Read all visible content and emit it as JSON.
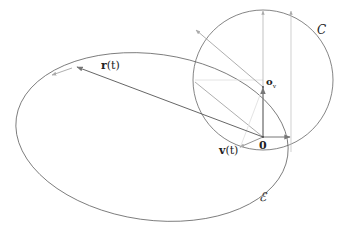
{
  "diagram": {
    "title": "",
    "labels": {
      "position_vector": "r(t)",
      "position_vector_bold": "r",
      "position_vector_arg": "(t)",
      "velocity_vector": "v(t)",
      "velocity_vector_bold": "v",
      "velocity_vector_arg": "(t)",
      "origin": "0",
      "circle_center": "o",
      "circle_center_subscript": "v",
      "circle": "C",
      "ellipse": "ℰ"
    },
    "shapes": {
      "ellipse": {
        "name": "ℰ",
        "cx": 152,
        "cy": 137,
        "rx": 137,
        "ry": 83,
        "rotation_deg": 8
      },
      "circle": {
        "name": "C",
        "cx": 263,
        "cy": 80,
        "r": 70
      }
    },
    "points": {
      "origin": {
        "x": 263,
        "y": 137
      },
      "o_v": {
        "x": 263,
        "y": 87
      },
      "r_tip": {
        "x": 76,
        "y": 67
      }
    },
    "colors": {
      "stroke_dark": "#555555",
      "stroke_gray": "#999999",
      "stroke_light": "#cccccc",
      "text": "#222222"
    }
  }
}
